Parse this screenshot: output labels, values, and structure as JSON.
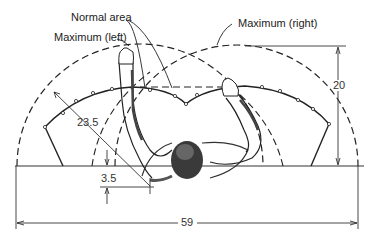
{
  "diagram": {
    "labels": {
      "normal_area": "Normal area",
      "maximum_left": "Maximum (left)",
      "maximum_right": "Maximum (right)"
    },
    "dimensions": {
      "width": "59",
      "height": "20",
      "radius": "23.5",
      "offset": "3.5"
    },
    "colors": {
      "line": "#222222",
      "background": "#ffffff",
      "shading": "#555555"
    }
  }
}
